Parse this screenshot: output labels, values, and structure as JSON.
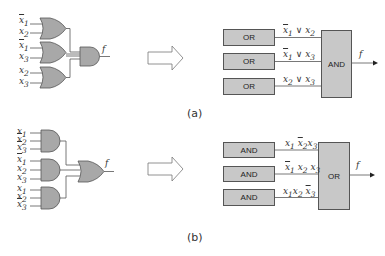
{
  "colors": {
    "gate_fill": "#a8a8a8",
    "box_fill": "#c8c8c8",
    "line": "#555555",
    "text": "#333333"
  },
  "part_a": {
    "caption": "(a)",
    "circuit": {
      "gates": [
        {
          "type": "OR",
          "inputs": [
            "x1-bar",
            "x2"
          ]
        },
        {
          "type": "OR",
          "inputs": [
            "x1-bar",
            "x3"
          ]
        },
        {
          "type": "OR",
          "inputs": [
            "x2",
            "x3"
          ]
        }
      ],
      "output_gate": "AND",
      "output_label": "f",
      "input_labels": [
        {
          "base": "x",
          "sub": "1",
          "bar": true
        },
        {
          "base": "x",
          "sub": "2",
          "bar": false
        },
        {
          "base": "x",
          "sub": "1",
          "bar": true
        },
        {
          "base": "x",
          "sub": "3",
          "bar": false
        },
        {
          "base": "x",
          "sub": "2",
          "bar": false
        },
        {
          "base": "x",
          "sub": "3",
          "bar": false
        }
      ]
    },
    "block": {
      "input_boxes": [
        "OR",
        "OR",
        "OR"
      ],
      "expressions": [
        "x̄1 ∨ x2",
        "x̄1 ∨ x3",
        "x2 ∨ x3"
      ],
      "output_box": "AND",
      "output_label": "f"
    }
  },
  "part_b": {
    "caption": "(b)",
    "circuit": {
      "gates": [
        {
          "type": "AND",
          "inputs": [
            "x1",
            "x2-bar",
            "x3-bar"
          ]
        },
        {
          "type": "AND",
          "inputs": [
            "x1-bar",
            "x2",
            "x3"
          ]
        },
        {
          "type": "AND",
          "inputs": [
            "x1",
            "x2",
            "x3-bar"
          ]
        }
      ],
      "output_gate": "OR",
      "output_label": "f"
    },
    "block": {
      "input_boxes": [
        "AND",
        "AND",
        "AND"
      ],
      "expressions": [
        "x1 x̄2x3",
        "x̄1 x2 x3",
        "x1x2 x̄3"
      ],
      "output_box": "OR",
      "output_label": "f"
    }
  },
  "transform_arrow": "hollow-right-arrow"
}
